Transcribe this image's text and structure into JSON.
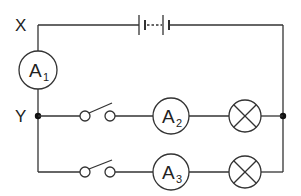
{
  "diagram": {
    "type": "circuit",
    "nodes": {
      "x": {
        "label": "X"
      },
      "y": {
        "label": "Y"
      }
    },
    "battery": {
      "name": "battery",
      "cells": "multiple (dashed between)"
    },
    "ammeters": [
      {
        "id": "A1",
        "letter": "A",
        "sub": "1",
        "position": "main line between X and Y"
      },
      {
        "id": "A2",
        "letter": "A",
        "sub": "2",
        "position": "upper parallel branch"
      },
      {
        "id": "A3",
        "letter": "A",
        "sub": "3",
        "position": "lower parallel branch"
      }
    ],
    "branches": [
      {
        "name": "upper",
        "components": [
          "open switch",
          "ammeter A2",
          "lamp"
        ]
      },
      {
        "name": "lower",
        "components": [
          "open switch",
          "ammeter A3",
          "lamp"
        ]
      }
    ],
    "colors": {
      "line": "#333333",
      "background": "#ffffff"
    }
  }
}
